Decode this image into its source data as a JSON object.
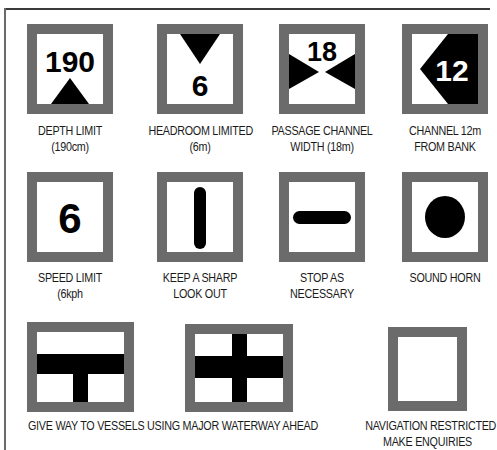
{
  "colors": {
    "border": "#6b6b6b",
    "symbol": "#000000",
    "background": "#ffffff",
    "text": "#1a1a1a"
  },
  "signs": [
    {
      "id": "depth-limit",
      "symbol": "number-with-triangle-up",
      "value": "190",
      "label_line1": "DEPTH LIMIT",
      "label_line2": "(190cm)"
    },
    {
      "id": "headroom-limited",
      "symbol": "triangle-down-with-number",
      "value": "6",
      "label_line1": "HEADROOM LIMITED",
      "label_line2": "(6m)"
    },
    {
      "id": "passage-channel-width",
      "symbol": "number-with-opposing-triangles",
      "value": "18",
      "label_line1": "PASSAGE CHANNEL",
      "label_line2": "WIDTH (18m)"
    },
    {
      "id": "channel-from-bank",
      "symbol": "arrow-left-with-number",
      "value": "12",
      "label_line1": "CHANNEL 12m",
      "label_line2": "FROM BANK"
    },
    {
      "id": "speed-limit",
      "symbol": "number",
      "value": "6",
      "label_line1": "SPEED LIMIT",
      "label_line2": "(6kph"
    },
    {
      "id": "keep-sharp-lookout",
      "symbol": "vertical-bar",
      "label_line1": "KEEP A SHARP",
      "label_line2": "LOOK OUT"
    },
    {
      "id": "stop-as-necessary",
      "symbol": "horizontal-bar",
      "label_line1": "STOP AS",
      "label_line2": "NECESSARY"
    },
    {
      "id": "sound-horn",
      "symbol": "dot",
      "label_line1": "SOUND HORN",
      "label_line2": ""
    },
    {
      "id": "give-way-major-waterway",
      "symbol": "t-junction",
      "label_line1": "",
      "label_line2": ""
    },
    {
      "id": "major-waterway-crossing",
      "symbol": "cross",
      "label_line1": "",
      "label_line2": ""
    },
    {
      "id": "navigation-restricted",
      "symbol": "empty",
      "label_line1": "NAVIGATION RESTRICTED",
      "label_line2": "MAKE ENQUIRIES"
    }
  ],
  "shared_label": "GIVE WAY TO VESSELS USING MAJOR WATERWAY AHEAD"
}
